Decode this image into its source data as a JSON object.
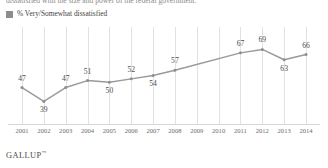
{
  "headline": {
    "clipped_text": "dissatisfied with the size and power of the federal government."
  },
  "legend": {
    "swatch_color": "#8d8d8d",
    "label": "% Very/Somewhat dissatisfied"
  },
  "footer": {
    "brand": "GALLUP",
    "trademark": "™"
  },
  "colors": {
    "line": "#9a9a9a",
    "marker": "#8f8f8f",
    "gridline": "#e2e2e2",
    "text": "#4a4a4a"
  },
  "chart_data": {
    "type": "line",
    "title": "",
    "xlabel": "",
    "ylabel": "",
    "ylim": [
      30,
      75
    ],
    "grid": "vertical",
    "legend_position": "top-left",
    "categories": [
      "2001",
      "2002",
      "2003",
      "2004",
      "2005",
      "2006",
      "2007",
      "2008",
      "2009",
      "2010",
      "2011",
      "2012",
      "2013",
      "2014"
    ],
    "series": [
      {
        "name": "% Very/Somewhat dissatisfied",
        "values": [
          47,
          39,
          47,
          51,
          50,
          52,
          54,
          57,
          null,
          null,
          67,
          69,
          63,
          66
        ],
        "labels": [
          "47",
          "39",
          "47",
          "51",
          "50",
          "52",
          "54",
          "57",
          "",
          "",
          "67",
          "69",
          "63",
          "66"
        ],
        "label_positions": [
          "above",
          "below",
          "above",
          "above",
          "below",
          "above",
          "below",
          "above",
          "",
          "",
          "above",
          "above",
          "below",
          "above"
        ]
      }
    ]
  }
}
